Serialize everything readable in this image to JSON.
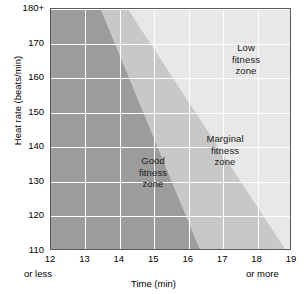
{
  "chart_data": {
    "type": "area",
    "title": "",
    "xlabel": "Time (min)",
    "ylabel": "Heat rate (beats/min)",
    "xlim": [
      12,
      19
    ],
    "ylim": [
      110,
      180
    ],
    "grid": true,
    "legend_position": "none",
    "x_ticks": [
      "12",
      "13",
      "14",
      "15",
      "16",
      "17",
      "18",
      "19"
    ],
    "x_tick_sub_first": "or less",
    "x_tick_sub_last": "or more",
    "y_ticks": [
      "180+",
      "170",
      "160",
      "150",
      "140",
      "130",
      "120",
      "110"
    ],
    "zones": [
      {
        "name": "good-fitness-zone",
        "label_line1": "Good",
        "label_line2": "fitness",
        "label_line3": "zone",
        "color": "#9c9c9c",
        "boundary_top_x": 13.45,
        "boundary_bottom_x": 16.35,
        "description": "Dark gray band on the left; upper-right diagonal edge runs from about 13.45 min at 180+ bpm down to 16.35 min at 110 bpm"
      },
      {
        "name": "marginal-fitness-zone",
        "label_line1": "Marginal",
        "label_line2": "fitness",
        "label_line3": "zone",
        "color": "#c8c8c8",
        "boundary_top_x": 14.25,
        "boundary_bottom_x": 18.85,
        "description": "Medium gray band in the middle; upper-right diagonal edge runs from about 14.25 min at 180+ bpm down to 18.85 min at 110 bpm"
      },
      {
        "name": "low-fitness-zone",
        "label_line1": "Low",
        "label_line2": "fitness",
        "label_line3": "zone",
        "color": "#e8e8e8",
        "description": "Lightest region filling the upper-right corner of the plot"
      }
    ]
  },
  "colors": {
    "good_zone": "#9c9c9c",
    "marginal_zone": "#c8c8c8",
    "low_zone": "#e8e8e8",
    "gridline": "#ffffff",
    "frame": "#5a5a5a",
    "text": "#000000"
  }
}
